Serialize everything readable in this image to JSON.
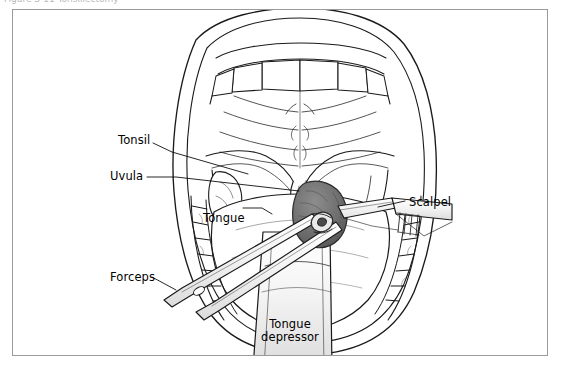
{
  "figure": {
    "cropped_caption": "Figure 3-11   Tonsillectomy",
    "frame_color": "#9a9a9a",
    "background_color": "#ffffff",
    "ink_color": "#1a1a1a",
    "tonsil_shade": "#6e6e6e"
  },
  "labels": [
    {
      "id": "tonsil",
      "text": "Tonsil",
      "x": 118,
      "y": 140
    },
    {
      "id": "uvula",
      "text": "Uvula",
      "x": 110,
      "y": 173
    },
    {
      "id": "tongue",
      "text": "Tongue",
      "x": 203,
      "y": 211
    },
    {
      "id": "scalpel",
      "text": "Scalpel",
      "x": 409,
      "y": 198
    },
    {
      "id": "forceps",
      "text": "Forceps",
      "x": 110,
      "y": 273
    },
    {
      "id": "tongue_depressor",
      "text": "Tongue depressor",
      "x": 253,
      "y": 323
    }
  ],
  "anatomy": [
    {
      "id": "upper-lip",
      "name": "Upper lip"
    },
    {
      "id": "lower-lip",
      "name": "Lower lip"
    },
    {
      "id": "upper-teeth",
      "name": "Upper teeth / incisors"
    },
    {
      "id": "lower-teeth",
      "name": "Lower teeth"
    },
    {
      "id": "hard-palate",
      "name": "Hard palate with rugae"
    },
    {
      "id": "soft-palate",
      "name": "Soft palate"
    },
    {
      "id": "uvula",
      "name": "Uvula"
    },
    {
      "id": "tonsil-left",
      "name": "Left palatine tonsil"
    },
    {
      "id": "tonsil-right",
      "name": "Right palatine tonsil (grasped)"
    },
    {
      "id": "tongue",
      "name": "Tongue"
    },
    {
      "id": "oropharynx",
      "name": "Oropharynx"
    }
  ],
  "instruments": [
    {
      "id": "forceps",
      "name": "Tonsil grasping forceps"
    },
    {
      "id": "scalpel",
      "name": "Scalpel"
    },
    {
      "id": "tongue-depressor",
      "name": "Tongue depressor"
    }
  ]
}
